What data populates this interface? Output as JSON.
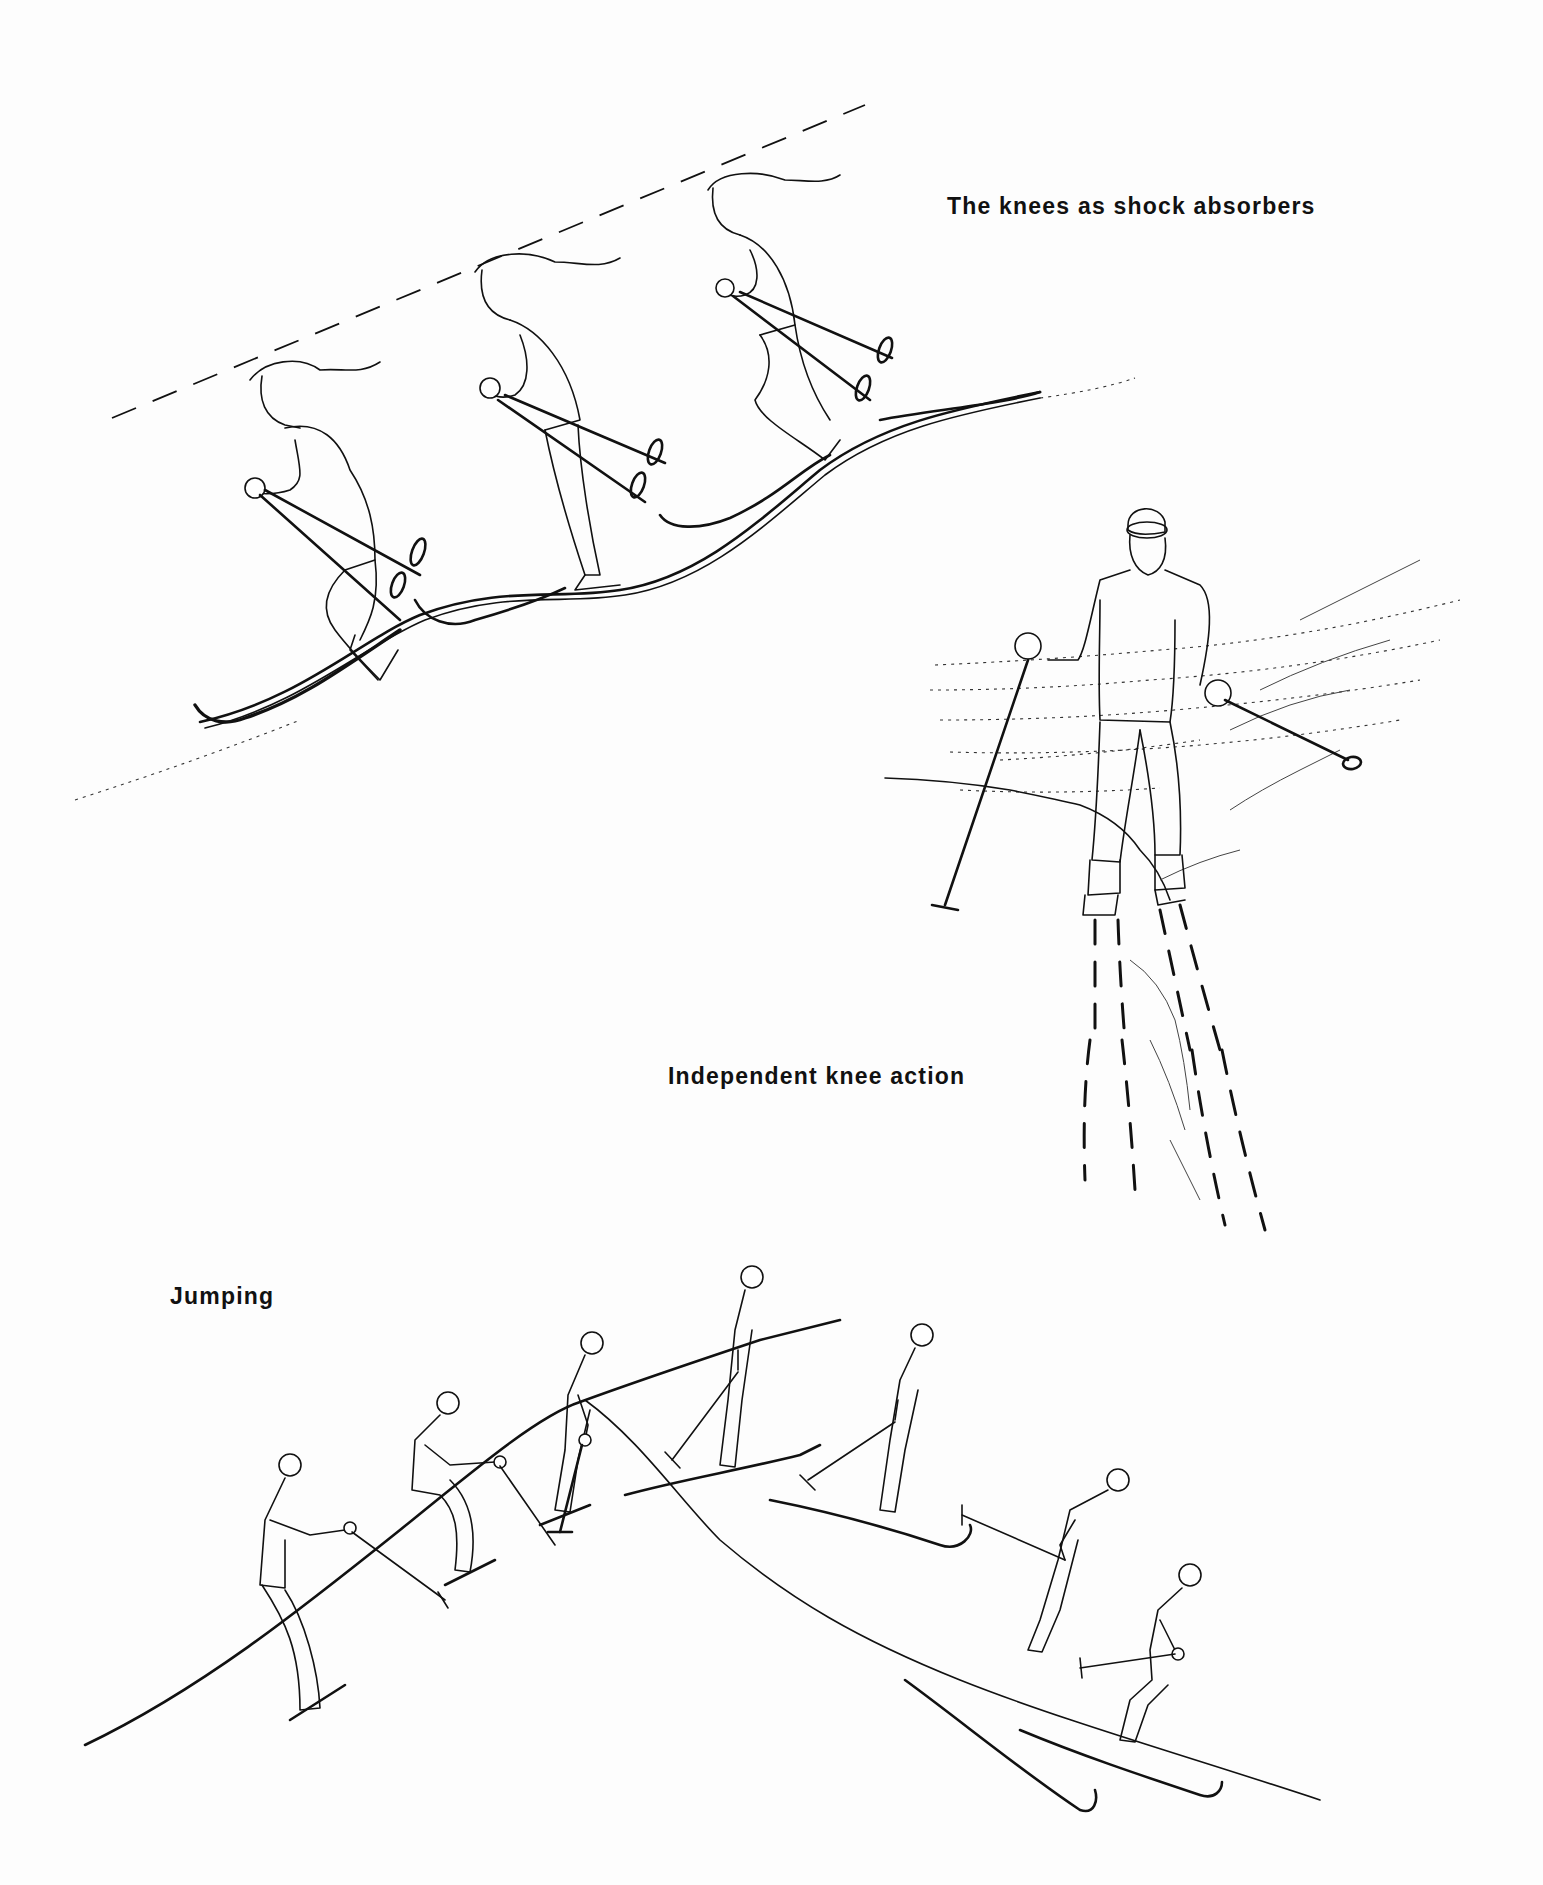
{
  "page": {
    "background": "#fdfdfd",
    "ink_color": "#111111"
  },
  "captions": {
    "shock_absorbers": "The knees as shock absorbers",
    "independent_knee": "Independent knee action",
    "jumping": "Jumping"
  },
  "illustrations": [
    {
      "id": "shock-absorbers",
      "caption_ref": "captions.shock_absorbers",
      "figure_count": 3,
      "subject": "skier with long hair crossing bumps, head held level along dashed line"
    },
    {
      "id": "independent-knee-action",
      "caption_ref": "captions.independent_knee",
      "figure_count": 1,
      "subject": "skier facing viewer over uneven terrain with dashed ski tracks"
    },
    {
      "id": "jumping",
      "caption_ref": "captions.jumping",
      "figure_count": 7,
      "subject": "sequence of skier taking off over a crest and landing"
    }
  ]
}
